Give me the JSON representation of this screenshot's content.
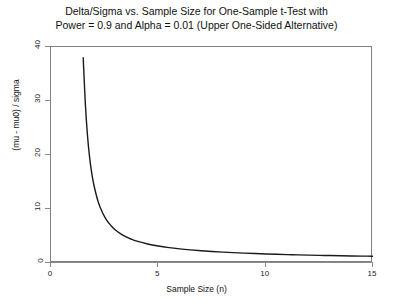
{
  "chart_data": {
    "type": "line",
    "title": "Delta/Sigma vs. Sample Size for One-Sample t-Test with Power = 0.9 and Alpha = 0.01 (Upper One-Sided Alternative)",
    "title_lines": [
      "Delta/Sigma vs. Sample Size for One-Sample t-Test with",
      "Power = 0.9 and Alpha = 0.01 (Upper One-Sided Alternative)"
    ],
    "xlabel": "Sample Size (n)",
    "ylabel": "(mu - mu0) / sigma",
    "xlim": [
      0,
      15
    ],
    "ylim": [
      0,
      40
    ],
    "xticks": [
      0,
      5,
      10,
      15
    ],
    "yticks": [
      0,
      10,
      20,
      30,
      40
    ],
    "xtick_labels": [
      "0",
      "5",
      "10",
      "15"
    ],
    "ytick_labels": [
      "0",
      "10",
      "20",
      "30",
      "40"
    ],
    "grid": false,
    "legend": "none",
    "line_color": "#1a1a1a",
    "line_width": 1.4,
    "series": [
      {
        "name": "delta/sigma",
        "x": [
          1.5,
          1.6,
          1.7,
          1.8,
          1.9,
          2.0,
          2.2,
          2.4,
          2.6,
          2.8,
          3.0,
          3.25,
          3.5,
          3.75,
          4.0,
          4.5,
          5.0,
          5.5,
          6.0,
          6.5,
          7.0,
          7.5,
          8.0,
          8.5,
          9.0,
          9.5,
          10.0,
          10.5,
          11.0,
          11.5,
          12.0,
          12.5,
          13.0,
          13.5,
          14.0,
          14.5,
          15.0
        ],
        "y": [
          38.0,
          29.5,
          23.6,
          19.5,
          16.6,
          14.4,
          11.3,
          9.3,
          7.9,
          6.9,
          6.1,
          5.4,
          4.85,
          4.4,
          4.05,
          3.52,
          3.14,
          2.85,
          2.62,
          2.43,
          2.27,
          2.14,
          2.02,
          1.92,
          1.83,
          1.75,
          1.68,
          1.62,
          1.56,
          1.51,
          1.46,
          1.42,
          1.38,
          1.34,
          1.31,
          1.28,
          1.25
        ]
      }
    ]
  }
}
